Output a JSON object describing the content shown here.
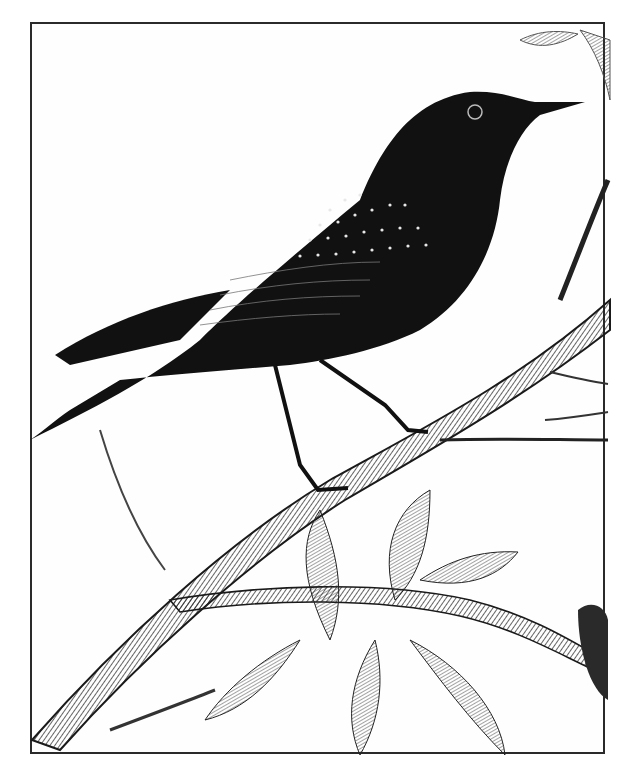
{
  "image": {
    "subject": "Engraved illustration of a starling perched on a branch",
    "style": "black-and-white engraving",
    "colors": {
      "ink": "#111111",
      "paper": "#ffffff",
      "frame": "#2a2a2a"
    }
  }
}
